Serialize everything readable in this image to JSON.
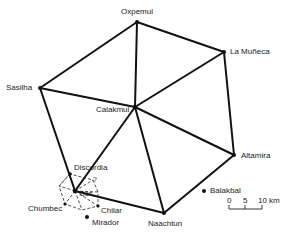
{
  "diagram": {
    "type": "site-network",
    "sites": [
      {
        "id": "oxpemul",
        "label": "Oxpemul",
        "x": 137,
        "y": 22,
        "lx": 120,
        "ly": 7
      },
      {
        "id": "lamuneca",
        "label": "La Muñeca",
        "x": 224,
        "y": 52,
        "lx": 230,
        "ly": 48
      },
      {
        "id": "sasilha",
        "label": "Sasilha",
        "x": 40,
        "y": 88,
        "lx": 5,
        "ly": 84
      },
      {
        "id": "calakmul",
        "label": "Calakmul",
        "x": 135,
        "y": 107,
        "lx": 96,
        "ly": 106
      },
      {
        "id": "altamira",
        "label": "Altamira",
        "x": 234,
        "y": 155,
        "lx": 241,
        "ly": 151
      },
      {
        "id": "naachtun",
        "label": "Naachtun",
        "x": 164,
        "y": 213,
        "lx": 148,
        "ly": 220
      },
      {
        "id": "discordia",
        "label": "Discordia",
        "x": 70,
        "y": 174,
        "lx": 74,
        "ly": 163
      },
      {
        "id": "center",
        "label": "Dos",
        "x": 75,
        "y": 191,
        "lx": 79,
        "ly": 190
      },
      {
        "id": "chumbec",
        "label": "Chumbec",
        "x": 65,
        "y": 204,
        "lx": 28,
        "ly": 205
      },
      {
        "id": "chilar",
        "label": "Chilar",
        "x": 98,
        "y": 206,
        "lx": 101,
        "ly": 207
      },
      {
        "id": "mirador",
        "label": "Mirador",
        "x": 87,
        "y": 217,
        "lx": 92,
        "ly": 219
      },
      {
        "id": "balakbal",
        "label": "Balakbal",
        "x": 204,
        "y": 191,
        "lx": 210,
        "ly": 187
      }
    ],
    "scale_bar": {
      "ticks": [
        "0",
        "5",
        "10 km"
      ]
    }
  }
}
